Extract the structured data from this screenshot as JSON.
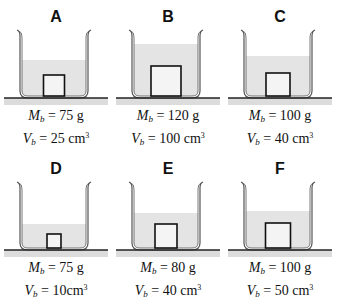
{
  "figure": {
    "panels": [
      {
        "letter": "A",
        "mass_symbol": "M",
        "mass_sub": "b",
        "mass": "= 75 g",
        "vol_symbol": "V",
        "vol_sub": "b",
        "vol": "= 25 cm",
        "vol_sup": "3",
        "water_top": 60,
        "block_w": 21,
        "block_h": 21
      },
      {
        "letter": "B",
        "mass_symbol": "M",
        "mass_sub": "b",
        "mass": "= 120 g",
        "vol_symbol": "V",
        "vol_sub": "b",
        "vol": "= 100 cm",
        "vol_sup": "3",
        "water_top": 44,
        "block_w": 30,
        "block_h": 30
      },
      {
        "letter": "C",
        "mass_symbol": "M",
        "mass_sub": "b",
        "mass": "= 100 g",
        "vol_symbol": "V",
        "vol_sub": "b",
        "vol": "= 40 cm",
        "vol_sup": "3",
        "water_top": 56,
        "block_w": 24,
        "block_h": 23
      },
      {
        "letter": "D",
        "mass_symbol": "M",
        "mass_sub": "b",
        "mass": "= 75 g",
        "vol_symbol": "V",
        "vol_sub": "b",
        "vol": "= 10cm",
        "vol_sup": "3",
        "water_top": 72,
        "block_w": 14,
        "block_h": 14
      },
      {
        "letter": "E",
        "mass_symbol": "M",
        "mass_sub": "b",
        "mass": "= 80 g",
        "vol_symbol": "V",
        "vol_sub": "b",
        "vol": "= 40 cm",
        "vol_sup": "3",
        "water_top": 61,
        "block_w": 22,
        "block_h": 24
      },
      {
        "letter": "F",
        "mass_symbol": "M",
        "mass_sub": "b",
        "mass": "= 100 g",
        "vol_symbol": "V",
        "vol_sub": "b",
        "vol": "= 50 cm",
        "vol_sup": "3",
        "water_top": 59,
        "block_w": 25,
        "block_h": 25
      }
    ],
    "colors": {
      "water": "#e4e4e4",
      "glass": "#555555",
      "block_fill": "#f4f4f4",
      "block_stroke": "#111111",
      "table": "#222222",
      "table_shadow": "#dcdcdc"
    }
  }
}
